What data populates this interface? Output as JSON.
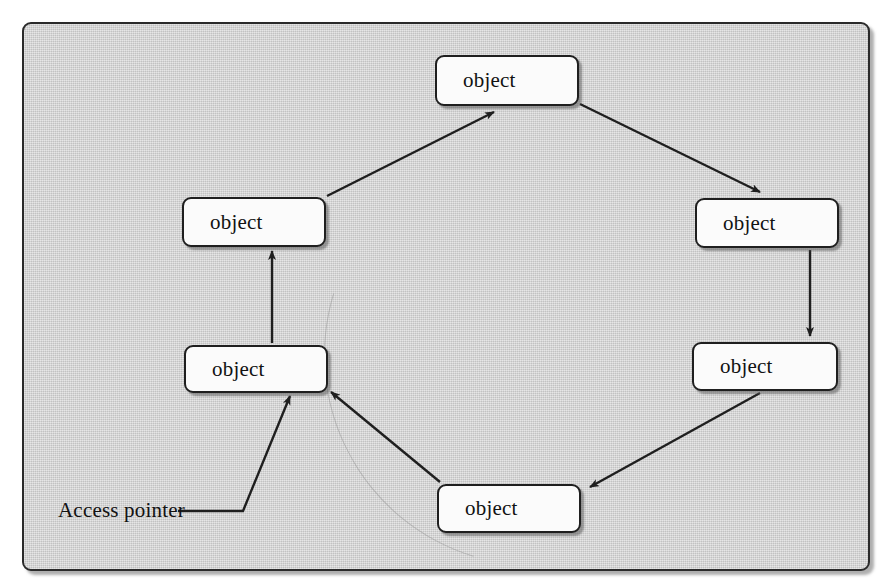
{
  "diagram": {
    "background_color": "#cfcfcf",
    "node_fill_color": "#fbfbfb",
    "line_color": "#1f1f1f",
    "nodes": [
      {
        "id": "top",
        "label": "object",
        "x": 435,
        "y": 55,
        "w": 144,
        "h": 51
      },
      {
        "id": "upper-right",
        "label": "object",
        "x": 695,
        "y": 198,
        "w": 144,
        "h": 50
      },
      {
        "id": "lower-right",
        "label": "object",
        "x": 692,
        "y": 342,
        "w": 146,
        "h": 49
      },
      {
        "id": "bottom",
        "label": "object",
        "x": 437,
        "y": 484,
        "w": 144,
        "h": 49
      },
      {
        "id": "lower-left",
        "label": "object",
        "x": 184,
        "y": 345,
        "w": 144,
        "h": 48
      },
      {
        "id": "upper-left",
        "label": "object",
        "x": 182,
        "y": 197,
        "w": 144,
        "h": 50
      }
    ],
    "edges": [
      {
        "from": "upper-left",
        "to": "top",
        "x1": 327,
        "y1": 196,
        "x2": 494,
        "y2": 112,
        "arrow": true
      },
      {
        "from": "top",
        "to": "upper-right",
        "x1": 580,
        "y1": 104,
        "x2": 760,
        "y2": 192,
        "arrow": true
      },
      {
        "from": "upper-right",
        "to": "lower-right",
        "x1": 810,
        "y1": 250,
        "x2": 810,
        "y2": 336,
        "arrow": true
      },
      {
        "from": "lower-right",
        "to": "bottom",
        "x1": 760,
        "y1": 393,
        "x2": 590,
        "y2": 487,
        "arrow": true
      },
      {
        "from": "bottom",
        "to": "lower-left",
        "x1": 440,
        "y1": 482,
        "x2": 331,
        "y2": 392,
        "arrow": true
      },
      {
        "from": "lower-left",
        "to": "upper-left",
        "x1": 272,
        "y1": 343,
        "x2": 272,
        "y2": 251,
        "arrow": true
      }
    ],
    "access_pointer": {
      "label": "Access pointer",
      "label_x": 58,
      "label_y": 500,
      "leader": {
        "x1": 178,
        "y1": 511,
        "x2": 243,
        "y2": 511,
        "x3": 290,
        "y3": 396
      },
      "arrow": true
    }
  }
}
